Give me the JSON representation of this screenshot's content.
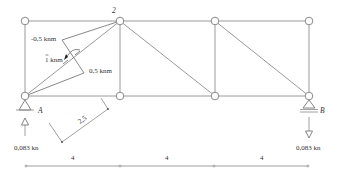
{
  "diagram": {
    "type": "truss-moment-diagram",
    "node_labels": {
      "A": "A",
      "B": "B",
      "top": "2"
    },
    "moments": {
      "upper": "-0,5 knm",
      "applied": "1 knm",
      "lower": "0,5 knm"
    },
    "reactions": {
      "A": "0,083 kn",
      "B": "0,083 kn"
    },
    "dimensions": {
      "lever_arm": "2,5",
      "spans": [
        "4",
        "4",
        "4"
      ]
    },
    "colors": {
      "lines": "#9a9a9a",
      "text": "#333333"
    }
  }
}
